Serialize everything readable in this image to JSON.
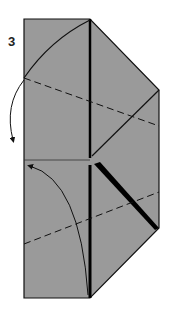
{
  "diagram": {
    "type": "origami-fold-instruction",
    "step_number": "3",
    "colors": {
      "paper": "#9a9a9a",
      "outline": "#111111",
      "background": "#ffffff"
    },
    "elements": {
      "paper_shape": "hexagonal flap with vertical center crease",
      "valley_folds": [
        "upper dashed diagonal",
        "lower dashed diagonal"
      ],
      "arrows": [
        "fold-behind arrow on left upper",
        "fold-up arrow on left lower"
      ]
    }
  }
}
